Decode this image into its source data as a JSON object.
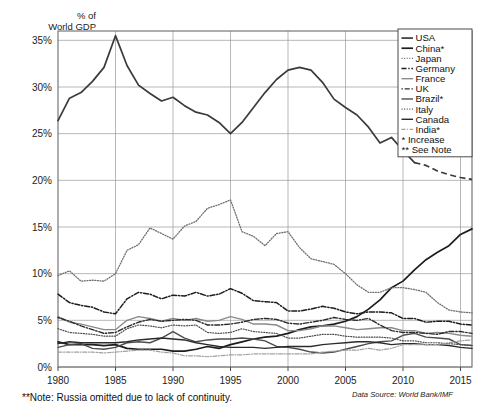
{
  "axis_title": "% of\nWorld GDP",
  "footnote": "**Note: Russia omitted due to lack of continuity.",
  "source": "Data Source: World Bank/IMF",
  "legend": {
    "items": [
      {
        "label": "USA",
        "style": "solid",
        "color": "#3a3a3a",
        "width": 1.7
      },
      {
        "label": "China*",
        "style": "solid",
        "color": "#1d1d1d",
        "width": 1.7
      },
      {
        "label": "Japan",
        "style": "dotted",
        "color": "#6e6e6e",
        "width": 1.3
      },
      {
        "label": "Germany",
        "style": "dashdot",
        "color": "#1d1d1d",
        "width": 1.5
      },
      {
        "label": "France",
        "style": "solid",
        "color": "#8a8a8a",
        "width": 1.4
      },
      {
        "label": "UK",
        "style": "dashdot2",
        "color": "#2b2b2b",
        "width": 1.4
      },
      {
        "label": "Brazil*",
        "style": "solid",
        "color": "#4d4d4d",
        "width": 1.4
      },
      {
        "label": "Italy",
        "style": "dotted",
        "color": "#4a4a4a",
        "width": 1.2
      },
      {
        "label": "Canada",
        "style": "solid",
        "color": "#2b2b2b",
        "width": 1.4
      },
      {
        "label": "India*",
        "style": "dashdot3",
        "color": "#a0a0a0",
        "width": 1.2
      },
      {
        "label": "* Increase",
        "style": "none",
        "color": "#000000",
        "width": 0
      },
      {
        "label": "** See Note",
        "style": "none",
        "color": "#000000",
        "width": 0
      }
    ]
  },
  "chart_data": {
    "type": "line",
    "title": "",
    "xlabel": "",
    "ylabel": "% of World GDP",
    "xlim": [
      1980,
      2016
    ],
    "ylim": [
      0,
      36
    ],
    "grid": true,
    "legend_position": "top-right",
    "xticks": [
      1980,
      1985,
      1990,
      1995,
      2000,
      2005,
      2010,
      2015
    ],
    "yticks": [
      0,
      5,
      10,
      15,
      20,
      25,
      30,
      35
    ],
    "ytick_labels": [
      "0%",
      "5%",
      "10%",
      "15%",
      "20%",
      "25%",
      "30%",
      "35%"
    ],
    "x": [
      1980,
      1981,
      1982,
      1983,
      1984,
      1985,
      1986,
      1987,
      1988,
      1989,
      1990,
      1991,
      1992,
      1993,
      1994,
      1995,
      1996,
      1997,
      1998,
      1999,
      2000,
      2001,
      2002,
      2003,
      2004,
      2005,
      2006,
      2007,
      2008,
      2009,
      2010,
      2011,
      2012,
      2013,
      2014,
      2015,
      2016
    ],
    "series": [
      {
        "name": "USA",
        "style": "solid",
        "dashed_from": 2011,
        "values": [
          26.4,
          28.8,
          29.4,
          30.6,
          32.1,
          35.5,
          32.3,
          30.2,
          29.3,
          28.5,
          28.9,
          28.0,
          27.3,
          27.0,
          26.2,
          25.0,
          26.2,
          27.8,
          29.4,
          30.8,
          31.8,
          32.1,
          31.8,
          30.5,
          28.7,
          27.8,
          27.0,
          25.7,
          24.0,
          24.6,
          23.2,
          21.9,
          21.6,
          21.0,
          20.6,
          20.3,
          20.1
        ]
      },
      {
        "name": "China*",
        "style": "solid",
        "values": [
          2.7,
          2.4,
          2.4,
          2.4,
          2.3,
          2.4,
          2.0,
          1.9,
          1.9,
          1.9,
          1.7,
          1.7,
          1.9,
          2.2,
          2.0,
          2.4,
          2.7,
          3.0,
          3.2,
          3.3,
          3.6,
          4.0,
          4.3,
          4.4,
          4.6,
          4.9,
          5.4,
          6.2,
          7.2,
          8.5,
          9.2,
          10.4,
          11.5,
          12.3,
          13.0,
          14.2,
          14.8
        ]
      },
      {
        "name": "Japan",
        "style": "dotted",
        "values": [
          9.8,
          10.3,
          9.2,
          9.3,
          9.2,
          10.0,
          12.5,
          13.1,
          14.9,
          14.3,
          13.7,
          15.1,
          15.6,
          17.0,
          17.4,
          17.9,
          14.5,
          14.0,
          13.0,
          14.3,
          14.5,
          12.8,
          11.6,
          11.3,
          11.0,
          10.0,
          8.8,
          8.0,
          8.0,
          8.5,
          8.5,
          8.3,
          8.0,
          6.9,
          6.1,
          5.9,
          5.8
        ]
      },
      {
        "name": "Germany",
        "style": "dashdot",
        "values": [
          7.8,
          6.9,
          6.6,
          6.4,
          5.9,
          5.7,
          7.3,
          8.0,
          7.8,
          7.3,
          7.7,
          7.6,
          8.0,
          7.6,
          7.8,
          8.4,
          7.9,
          7.1,
          7.0,
          6.9,
          6.0,
          6.0,
          6.2,
          6.5,
          6.3,
          5.9,
          5.7,
          5.9,
          5.9,
          5.8,
          5.2,
          5.2,
          4.8,
          4.9,
          4.9,
          4.6,
          4.5
        ]
      },
      {
        "name": "France",
        "style": "solid",
        "values": [
          5.4,
          4.8,
          4.6,
          4.3,
          4.0,
          4.0,
          5.0,
          5.4,
          5.2,
          4.9,
          5.2,
          5.0,
          5.2,
          4.9,
          5.0,
          5.4,
          5.1,
          4.6,
          4.6,
          4.5,
          3.9,
          3.9,
          4.1,
          4.4,
          4.4,
          4.2,
          4.0,
          4.1,
          4.2,
          4.2,
          3.9,
          3.9,
          3.6,
          3.7,
          3.6,
          3.4,
          3.3
        ]
      },
      {
        "name": "UK",
        "style": "dashdot2",
        "values": [
          5.3,
          4.9,
          4.4,
          4.0,
          3.6,
          3.7,
          4.3,
          4.8,
          5.1,
          4.9,
          5.0,
          5.1,
          5.0,
          4.5,
          4.5,
          4.6,
          4.8,
          5.1,
          5.2,
          5.1,
          4.7,
          4.6,
          4.8,
          5.0,
          5.3,
          5.1,
          5.0,
          5.2,
          4.5,
          3.9,
          3.7,
          3.7,
          3.6,
          3.5,
          3.8,
          3.8,
          3.6
        ]
      },
      {
        "name": "Brazil*",
        "style": "solid",
        "values": [
          2.1,
          2.4,
          2.5,
          2.0,
          1.9,
          2.1,
          2.6,
          2.7,
          2.6,
          3.1,
          3.8,
          3.1,
          2.7,
          2.9,
          3.0,
          3.0,
          3.1,
          3.0,
          2.8,
          2.2,
          2.1,
          1.9,
          1.6,
          1.5,
          1.6,
          1.9,
          2.2,
          2.5,
          2.7,
          2.8,
          3.4,
          3.6,
          3.2,
          3.1,
          3.0,
          2.4,
          2.3
        ]
      },
      {
        "name": "Italy",
        "style": "dotted",
        "values": [
          4.1,
          3.7,
          3.6,
          3.5,
          3.3,
          3.3,
          4.1,
          4.5,
          4.4,
          4.2,
          4.5,
          4.4,
          4.5,
          3.7,
          3.6,
          3.7,
          4.1,
          3.8,
          3.7,
          3.6,
          3.1,
          3.1,
          3.3,
          3.5,
          3.5,
          3.3,
          3.2,
          3.2,
          3.2,
          3.1,
          2.8,
          2.8,
          2.6,
          2.6,
          2.5,
          2.4,
          2.3
        ]
      },
      {
        "name": "Canada",
        "style": "solid",
        "values": [
          2.5,
          2.7,
          2.6,
          2.6,
          2.6,
          2.6,
          2.7,
          2.9,
          3.0,
          3.1,
          3.0,
          2.9,
          2.6,
          2.4,
          2.2,
          2.1,
          2.1,
          2.1,
          2.0,
          2.1,
          2.2,
          2.2,
          2.2,
          2.4,
          2.5,
          2.6,
          2.7,
          2.7,
          2.6,
          2.4,
          2.5,
          2.5,
          2.4,
          2.4,
          2.3,
          2.1,
          2.0
        ]
      },
      {
        "name": "India*",
        "style": "dashdot3",
        "values": [
          1.6,
          1.6,
          1.6,
          1.6,
          1.5,
          1.6,
          1.7,
          1.8,
          1.8,
          1.6,
          1.5,
          1.2,
          1.2,
          1.1,
          1.2,
          1.3,
          1.3,
          1.4,
          1.4,
          1.4,
          1.4,
          1.4,
          1.4,
          1.6,
          1.7,
          1.8,
          1.8,
          2.0,
          1.8,
          2.0,
          2.4,
          2.4,
          2.4,
          2.4,
          2.6,
          2.8,
          2.9
        ]
      }
    ]
  }
}
